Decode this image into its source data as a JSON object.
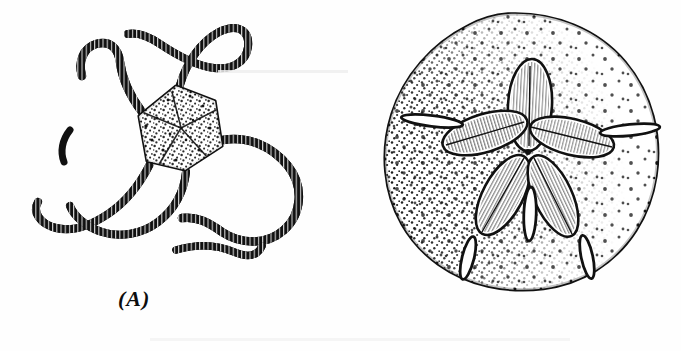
{
  "figure": {
    "background_color": "#fefefe",
    "ink_color": "#111111",
    "panels": [
      {
        "id": "A",
        "caption": "(A)",
        "subject": "brittle-star",
        "subject_label": "brittle star (Ophiuroidea)",
        "features": {
          "disc_shape": "pentagonal",
          "disc_texture": "stippled",
          "arm_count": 5,
          "arm_texture": "segmented-with-spines"
        }
      },
      {
        "id": "B",
        "caption": "(B)",
        "subject": "sand-dollar",
        "subject_label": "keyhole sand dollar (Clypeasteroida)",
        "features": {
          "test_shape": "round-flattened",
          "test_texture": "stippled",
          "petal_count": 5,
          "lunule_count": 5,
          "lunule_positions": [
            "left",
            "right",
            "bottom-left",
            "bottom-center",
            "bottom-right"
          ]
        }
      }
    ]
  }
}
